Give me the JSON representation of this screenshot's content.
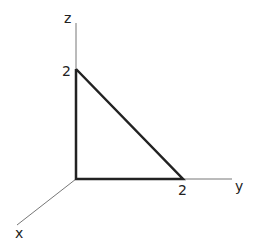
{
  "diagram": {
    "type": "3d-axes-triangle",
    "axes": [
      {
        "name": "x",
        "label": "x"
      },
      {
        "name": "y",
        "label": "y"
      },
      {
        "name": "z",
        "label": "z"
      }
    ],
    "intercepts": {
      "z": "2",
      "y": "2"
    },
    "shape": "right triangle in the y-z plane with vertices at origin, (0,2,0) and (0,0,2)",
    "colors": {
      "axis": "#777777",
      "triangle": "#222222",
      "text": "#222222"
    }
  }
}
